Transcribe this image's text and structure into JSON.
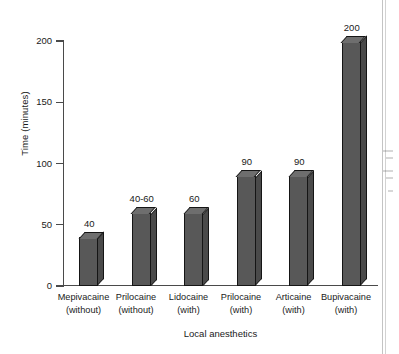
{
  "chart_data": {
    "type": "bar",
    "title": "",
    "subtitle": "",
    "xlabel": "Local anesthetics",
    "ylabel": "Time (minutes)",
    "categories": [
      "Mepivacaine (without)",
      "Prilocaine (without)",
      "Lidocaine (with)",
      "Prilocaine (with)",
      "Articaine (with)",
      "Bupivacaine (with)"
    ],
    "category_lines": [
      {
        "line1": "Mepivacaine",
        "line2": "(without)"
      },
      {
        "line1": "Prilocaine",
        "line2": "(without)"
      },
      {
        "line1": "Lidocaine",
        "line2": "(with)"
      },
      {
        "line1": "Prilocaine",
        "line2": "(with)"
      },
      {
        "line1": "Articaine",
        "line2": "(with)"
      },
      {
        "line1": "Bupivacaine",
        "line2": "(with)"
      }
    ],
    "values": [
      40,
      60,
      60,
      90,
      90,
      200
    ],
    "data_labels": [
      "40",
      "40-60",
      "60",
      "90",
      "90",
      "200"
    ],
    "ylim": [
      0,
      200
    ],
    "yticks": [
      0,
      50,
      100,
      150,
      200
    ],
    "ytick_labels": [
      "0",
      "50",
      "100",
      "150",
      "200"
    ],
    "grid": false,
    "legend": null,
    "bar_color": "#585858",
    "bar_top_color": "#6e6e6e",
    "bar_side_color": "#4a4a4a",
    "bar_outline_color": "#151515",
    "axis_color": "#4a4a4a",
    "background": "#ffffff"
  }
}
